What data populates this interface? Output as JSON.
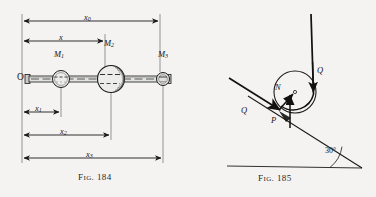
{
  "page": {
    "background_color": "#f4f3f1",
    "ink_color": "#1b1b1b",
    "width": 376,
    "height": 197
  },
  "figures": [
    {
      "id": "fig-184",
      "caption_prefix": "F",
      "caption_small": "IG",
      "caption_number": ". 184",
      "caption_full": "FIG. 184",
      "description": "Horizontal rod with three masses and four dimension lines",
      "origin_label": "O",
      "masses": [
        {
          "name": "M",
          "subscript": "1",
          "label": "M₁",
          "cx": 61,
          "cy": 79,
          "r": 8.5
        },
        {
          "name": "M",
          "subscript": "2",
          "label": "M₂",
          "cx": 111,
          "cy": 79,
          "r": 13.5
        },
        {
          "name": "M",
          "subscript": "3",
          "label": "M₃",
          "cx": 163,
          "cy": 79,
          "r": 6.5
        }
      ],
      "mass_labels": [
        {
          "text": "M",
          "sub": "1",
          "x": 54,
          "y": 56
        },
        {
          "text": "M",
          "sub": "2",
          "x": 103,
          "y": 45
        },
        {
          "text": "M",
          "sub": "3",
          "x": 158,
          "y": 56
        }
      ],
      "dimensions": [
        {
          "text": "x",
          "sub": "0",
          "x1": 22,
          "x2": 160,
          "y": 21,
          "label_x": 87,
          "label_y": 14
        },
        {
          "text": "x",
          "sub": "",
          "x1": 22,
          "x2": 105,
          "y": 41,
          "label_x": 60,
          "label_y": 34
        },
        {
          "text": "x",
          "sub": "1",
          "x1": 22,
          "x2": 61,
          "y": 112,
          "label_x": 37,
          "label_y": 105
        },
        {
          "text": "x",
          "sub": "2",
          "x1": 22,
          "x2": 111,
          "y": 135,
          "label_x": 62,
          "label_y": 127
        },
        {
          "text": "x",
          "sub": "3",
          "x1": 22,
          "x2": 163,
          "y": 158,
          "label_x": 88,
          "label_y": 150
        }
      ]
    },
    {
      "id": "fig-185",
      "caption_prefix": "F",
      "caption_small": "IG",
      "caption_number": ". 185",
      "caption_full": "FIG. 185",
      "description": "Cylinder on a 30 degree inclined plane with cord tensions Q, normal force N and friction force P",
      "angle_label": "30°",
      "angle_value": 30,
      "force_labels": [
        {
          "text": "Q",
          "x": 244,
          "y": 112,
          "meaning": "cord-tension-along-incline"
        },
        {
          "text": "Q",
          "x": 318,
          "y": 73,
          "meaning": "cord-tension-vertical"
        },
        {
          "text": "N",
          "x": 277,
          "y": 89,
          "meaning": "normal-reaction"
        },
        {
          "text": "P",
          "x": 273,
          "y": 119,
          "meaning": "friction-force"
        }
      ],
      "circle": {
        "cx": 295,
        "cy": 92,
        "r": 21
      }
    }
  ]
}
